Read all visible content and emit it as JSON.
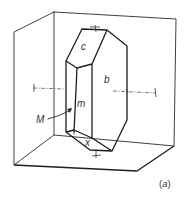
{
  "figure": {
    "caption": "(a)",
    "caption_prefix": "(",
    "caption_letter": "a",
    "caption_suffix": ")",
    "face_labels": {
      "c": "c",
      "b": "b",
      "m": "m",
      "M": "M",
      "x": "x"
    },
    "line_color": "#2a2a2a",
    "background": "#ffffff"
  }
}
